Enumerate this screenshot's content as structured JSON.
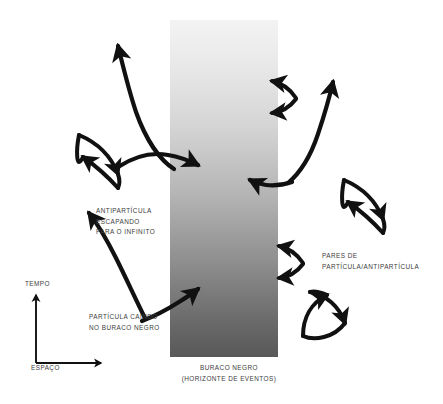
{
  "diagram": {
    "title_concept": "Hawking radiation near a black hole event horizon",
    "language": "pt-BR",
    "colors": {
      "background": "#ffffff",
      "arrow_stroke": "#111111",
      "text": "#3c3c3c",
      "horizon_gradient_top": "#f2f2f2",
      "horizon_gradient_bottom": "#585858"
    }
  },
  "axes": {
    "time_label": "TEMPO",
    "space_label": "ESPAÇO"
  },
  "labels": {
    "antiparticle_escaping": "ANTIPARTÍCULA\nESCAPANDO\nPARA O INFINITO",
    "particle_falling": "PARTÍCULA CAINDO\nNO BURACO NEGRO",
    "pairs": "PARES DE\nPARTÍCULA/ANTIPARTÍCULA",
    "black_hole": "BURACO NEGRO\n(HORIZONTE DE EVENTOS)"
  },
  "elements": {
    "horizon_band": {
      "name": "event-horizon-band",
      "x": 170,
      "y": 20,
      "width": 108,
      "height": 337
    },
    "particle_pairs_count": 5,
    "escaping_trajectories_count": 2,
    "infalling_trajectories_count": 2
  }
}
